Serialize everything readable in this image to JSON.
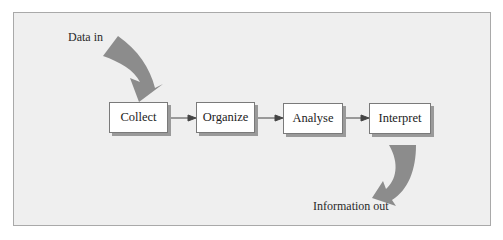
{
  "diagram": {
    "input_label": "Data in",
    "output_label": "Information out",
    "steps": [
      {
        "label": "Collect"
      },
      {
        "label": "Organize"
      },
      {
        "label": "Analyse"
      },
      {
        "label": "Interpret"
      }
    ],
    "colors": {
      "background": "#efefef",
      "flow_arrow": "#8c8c8c",
      "box_fill": "#ffffff",
      "connector": "#444444"
    }
  }
}
